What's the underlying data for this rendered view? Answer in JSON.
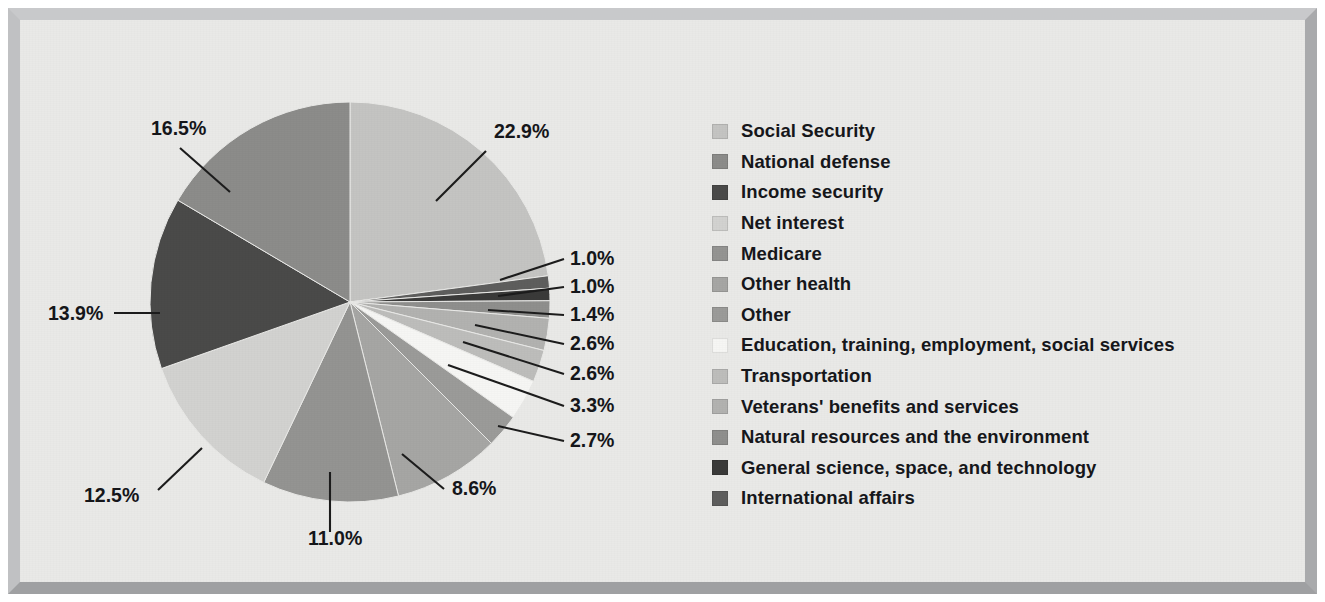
{
  "figure": {
    "background_color": "#e9e9e7",
    "frame_color": "#c0c1c3",
    "text_color": "#16171b"
  },
  "legend": {
    "position": "right",
    "items": [
      {
        "label": "Social Security",
        "color": "#c4c4c2"
      },
      {
        "label": "National defense",
        "color": "#8c8c8a"
      },
      {
        "label": "Income security",
        "color": "#4a4a49"
      },
      {
        "label": "Net interest",
        "color": "#d2d2d0"
      },
      {
        "label": "Medicare",
        "color": "#949492"
      },
      {
        "label": "Other health",
        "color": "#a6a6a4"
      },
      {
        "label": "Other",
        "color": "#9b9b99"
      },
      {
        "label": "Education, training, employment, social services",
        "color": "#f6f6f4"
      },
      {
        "label": "Transportation",
        "color": "#bdbdbb"
      },
      {
        "label": "Veterans' benefits and services",
        "color": "#b2b2b0"
      },
      {
        "label": "Natural resources and the environment",
        "color": "#8f8f8d"
      },
      {
        "label": "General science, space, and technology",
        "color": "#3a3a39"
      },
      {
        "label": "International affairs",
        "color": "#5e5e5d"
      }
    ]
  },
  "chart_data": {
    "type": "pie",
    "title": "",
    "unit": "percent",
    "total": 100.0,
    "start_angle_deg": 0,
    "direction": "clockwise",
    "categories": [
      "Social Security",
      "National defense",
      "Income security",
      "Net interest",
      "Medicare",
      "Other health",
      "Other",
      "Education, training, employment, social services",
      "Transportation",
      "Veterans' benefits and services",
      "Natural resources and the environment",
      "General science, space, and technology",
      "International affairs"
    ],
    "values": [
      22.9,
      16.5,
      13.9,
      12.5,
      11.0,
      8.6,
      2.7,
      3.3,
      2.6,
      2.6,
      1.4,
      1.0,
      1.0
    ],
    "labels": [
      "22.9%",
      "16.5%",
      "13.9%",
      "12.5%",
      "11.0%",
      "8.6%",
      "2.7%",
      "3.3%",
      "2.6%",
      "2.6%",
      "1.4%",
      "1.0%",
      "1.0%"
    ],
    "slices": [
      {
        "name": "Social Security",
        "value": 22.9,
        "label": "22.9%",
        "color": "#c4c4c2"
      },
      {
        "name": "International affairs",
        "value": 1.0,
        "label": "1.0%",
        "color": "#5e5e5d"
      },
      {
        "name": "General science, space, and technology",
        "value": 1.0,
        "label": "1.0%",
        "color": "#3a3a39"
      },
      {
        "name": "Natural resources and the environment",
        "value": 1.4,
        "label": "1.4%",
        "color": "#8f8f8d"
      },
      {
        "name": "Veterans' benefits and services",
        "value": 2.6,
        "label": "2.6%",
        "color": "#b2b2b0"
      },
      {
        "name": "Transportation",
        "value": 2.6,
        "label": "2.6%",
        "color": "#bdbdbb"
      },
      {
        "name": "Education, training, employment, social services",
        "value": 3.3,
        "label": "3.3%",
        "color": "#f6f6f4"
      },
      {
        "name": "Other",
        "value": 2.7,
        "label": "2.7%",
        "color": "#9b9b99"
      },
      {
        "name": "Other health",
        "value": 8.6,
        "label": "8.6%",
        "color": "#a6a6a4"
      },
      {
        "name": "Medicare",
        "value": 11.0,
        "label": "11.0%",
        "color": "#949492"
      },
      {
        "name": "Net interest",
        "value": 12.5,
        "label": "12.5%",
        "color": "#d2d2d0"
      },
      {
        "name": "Income security",
        "value": 13.9,
        "label": "13.9%",
        "color": "#4a4a49"
      },
      {
        "name": "National defense",
        "value": 16.5,
        "label": "16.5%",
        "color": "#8c8c8a"
      }
    ],
    "geometry": {
      "cx": 330,
      "cy": 282,
      "r": 200
    },
    "callouts": [
      {
        "label": "22.9%",
        "text_x": 474,
        "text_y": 118,
        "anchor": "start",
        "lx1": 466,
        "ly1": 131,
        "lx2": 416,
        "ly2": 181
      },
      {
        "label": "1.0%",
        "text_x": 550,
        "text_y": 245,
        "anchor": "start",
        "lx1": 544,
        "ly1": 239,
        "lx2": 480,
        "ly2": 260
      },
      {
        "label": "1.0%",
        "text_x": 550,
        "text_y": 273,
        "anchor": "start",
        "lx1": 544,
        "ly1": 267,
        "lx2": 478,
        "ly2": 276
      },
      {
        "label": "1.4%",
        "text_x": 550,
        "text_y": 301,
        "anchor": "start",
        "lx1": 544,
        "ly1": 295,
        "lx2": 468,
        "ly2": 290
      },
      {
        "label": "2.6%",
        "text_x": 550,
        "text_y": 330,
        "anchor": "start",
        "lx1": 544,
        "ly1": 324,
        "lx2": 455,
        "ly2": 305
      },
      {
        "label": "2.6%",
        "text_x": 550,
        "text_y": 360,
        "anchor": "start",
        "lx1": 544,
        "ly1": 354,
        "lx2": 443,
        "ly2": 322
      },
      {
        "label": "3.3%",
        "text_x": 550,
        "text_y": 392,
        "anchor": "start",
        "lx1": 544,
        "ly1": 386,
        "lx2": 428,
        "ly2": 345
      },
      {
        "label": "2.7%",
        "text_x": 550,
        "text_y": 427,
        "anchor": "start",
        "lx1": 544,
        "ly1": 421,
        "lx2": 478,
        "ly2": 406
      },
      {
        "label": "8.6%",
        "text_x": 432,
        "text_y": 475,
        "anchor": "start",
        "lx1": 424,
        "ly1": 469,
        "lx2": 382,
        "ly2": 434
      },
      {
        "label": "11.0%",
        "text_x": 288,
        "text_y": 525,
        "anchor": "start",
        "lx1": 310,
        "ly1": 512,
        "lx2": 310,
        "ly2": 452
      },
      {
        "label": "12.5%",
        "text_x": 64,
        "text_y": 482,
        "anchor": "start",
        "lx1": 138,
        "ly1": 470,
        "lx2": 182,
        "ly2": 428
      },
      {
        "label": "13.9%",
        "text_x": 28,
        "text_y": 300,
        "anchor": "start",
        "lx1": 94,
        "ly1": 293,
        "lx2": 140,
        "ly2": 293
      },
      {
        "label": "16.5%",
        "text_x": 131,
        "text_y": 115,
        "anchor": "start",
        "lx1": 160,
        "ly1": 128,
        "lx2": 210,
        "ly2": 172
      }
    ]
  }
}
